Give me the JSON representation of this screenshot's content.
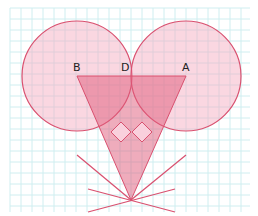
{
  "figure": {
    "grid": {
      "x0": 10,
      "y0": 8,
      "x1": 250,
      "y1": 212,
      "step": 11,
      "color": "#cfeef0"
    },
    "colors": {
      "circle_fill": "#f3a6bd",
      "circle_fill_opacity": 0.45,
      "stroke": "#d9506f",
      "triangle_fill": "#e05a7a",
      "triangle_fill_opacity": 0.5,
      "diamond_fill": "#f9d0dc"
    },
    "circles": [
      {
        "id": "left-circle",
        "cx": 77,
        "cy": 76,
        "r": 55
      },
      {
        "id": "right-circle",
        "cx": 186,
        "cy": 76,
        "r": 55
      }
    ],
    "triangle": {
      "points": [
        [
          77,
          76
        ],
        [
          186,
          76
        ],
        [
          131,
          200
        ]
      ]
    },
    "diamonds": [
      {
        "cx": 121,
        "cy": 132,
        "h": 10
      },
      {
        "cx": 142,
        "cy": 132,
        "h": 10
      }
    ],
    "rays": [
      {
        "x1": 77,
        "y1": 155,
        "x2": 131,
        "y2": 200
      },
      {
        "x1": 186,
        "y1": 155,
        "x2": 131,
        "y2": 200
      },
      {
        "x1": 88,
        "y1": 189,
        "x2": 175,
        "y2": 212
      },
      {
        "x1": 175,
        "y1": 189,
        "x2": 88,
        "y2": 212
      }
    ],
    "points": [
      {
        "label": "B",
        "x": 73,
        "y": 62
      },
      {
        "label": "D",
        "x": 121,
        "y": 62
      },
      {
        "label": "A",
        "x": 182,
        "y": 62
      }
    ]
  }
}
